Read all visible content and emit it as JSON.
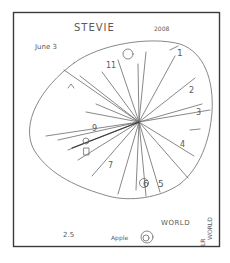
{
  "drawing": {
    "title": "STEVIE",
    "year": "2008",
    "date": "June 3",
    "clock_numbers": [
      {
        "n": "1",
        "x": 177,
        "y": 56
      },
      {
        "n": "2",
        "x": 189,
        "y": 93
      },
      {
        "n": "3",
        "x": 196,
        "y": 115
      },
      {
        "n": "4",
        "x": 180,
        "y": 147
      },
      {
        "n": "5",
        "x": 158,
        "y": 187
      },
      {
        "n": "6",
        "x": 143,
        "y": 187
      },
      {
        "n": "7",
        "x": 108,
        "y": 168
      },
      {
        "n": "9",
        "x": 92,
        "y": 131
      },
      {
        "n": "11",
        "x": 106,
        "y": 68
      }
    ],
    "bottom_labels": {
      "world": "WORLD",
      "world_vertical": "WORLD",
      "apple": "Apple",
      "number": "2.5",
      "lr": "LR"
    },
    "colors": {
      "ink": "#6a6a6a",
      "frame": "#3c3c3c",
      "paper": "#ffffff"
    }
  }
}
